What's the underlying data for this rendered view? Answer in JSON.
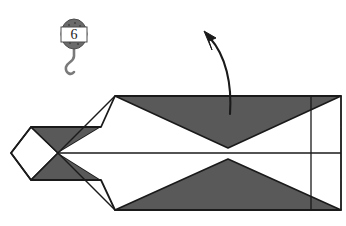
{
  "figure": {
    "kind": "origami-fold-diagram",
    "background_color": "#ffffff",
    "line_color": "#1a1a1a",
    "shaded_color": "#595959",
    "paper_color": "#ffffff"
  },
  "step_marker": {
    "icon_name": "pulley-hook-icon",
    "number": "6",
    "body_color": "#6b6b6b",
    "band_color": "#ffffff",
    "hook_color": "#7a7a7a",
    "center_x": 74,
    "center_y": 34
  },
  "arrow": {
    "name": "fold-arrow",
    "label": "",
    "direction": "up-left",
    "head_x": 205,
    "head_y": 33,
    "tail_x": 230,
    "tail_y": 114,
    "color": "#1a1a1a"
  },
  "model": {
    "outline_top_y": 96,
    "outline_bottom_y": 210,
    "center_line_y": 153,
    "right_edge_x": 341,
    "body_left_x": 115,
    "tip_left_x": 11,
    "inner_vertical_x": 311,
    "shaded_regions": [
      "upper-right-triangle",
      "lower-right-triangle",
      "left-upper-wedge",
      "left-lower-wedge"
    ]
  },
  "labels": {
    "step_caption": ""
  }
}
